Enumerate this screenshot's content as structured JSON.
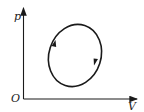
{
  "diagram": {
    "type": "p-V cycle diagram",
    "axes": {
      "y_label": "p",
      "x_label": "V",
      "origin_label": "O"
    },
    "cycle": {
      "shape": "ellipse",
      "direction": "clockwise",
      "arrow_count": 2
    },
    "colors": {
      "line": "#1a1a1a",
      "background": "#ffffff"
    }
  }
}
